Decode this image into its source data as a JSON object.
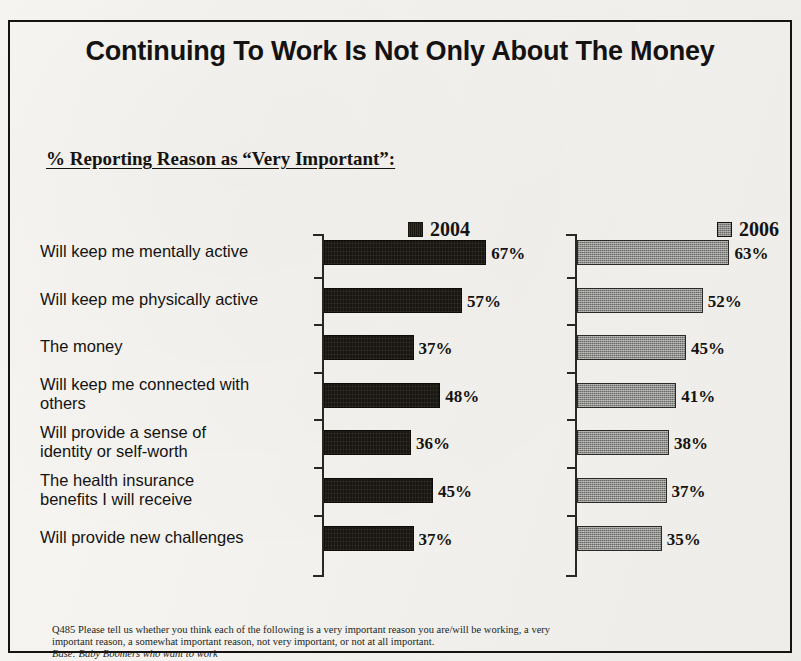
{
  "slide": {
    "title": "Continuing To Work Is Not Only About The Money",
    "subtitle": "% Reporting Reason as “Very Important”:"
  },
  "legend": [
    {
      "label": "2004",
      "swatch": "dark-square-icon",
      "color": "#181510"
    },
    {
      "label": "2006",
      "swatch": "gray-square-icon",
      "color": "#8d8d8b"
    }
  ],
  "footnote": {
    "question": "Q485  Please tell us whether you think each of the following is a very important reason you are/will be working, a very important reason, a somewhat important reason, not very important, or not at all important.",
    "base": "Base:  Baby Boomers who want to work"
  },
  "chart_data": {
    "type": "bar",
    "orientation": "horizontal",
    "title": "Continuing To Work Is Not Only About The Money",
    "subtitle": "% Reporting Reason as “Very Important”:",
    "xlabel": "",
    "ylabel": "",
    "xlim": [
      0,
      100
    ],
    "grid": false,
    "legend_position": "top",
    "panels": [
      "2004",
      "2006"
    ],
    "categories": [
      "Will keep me mentally active",
      "Will keep me physically active",
      "The money",
      "Will keep me connected with others",
      "Will provide a sense of identity or self-worth",
      "The health insurance benefits I will receive",
      "Will provide new challenges"
    ],
    "series": [
      {
        "name": "2004",
        "color": "#181510",
        "values": [
          67,
          57,
          37,
          48,
          36,
          45,
          37
        ]
      },
      {
        "name": "2006",
        "color": "#8d8d8b",
        "values": [
          63,
          52,
          45,
          41,
          38,
          37,
          35
        ]
      }
    ],
    "value_labels": {
      "2004": [
        "67%",
        "57%",
        "37%",
        "48%",
        "36%",
        "45%",
        "37%"
      ],
      "2006": [
        "63%",
        "52%",
        "45%",
        "41%",
        "38%",
        "37%",
        "35%"
      ]
    }
  },
  "category_lines": [
    [
      "Will keep me mentally active"
    ],
    [
      "Will keep me physically active"
    ],
    [
      "The money"
    ],
    [
      "Will keep me connected with",
      "others"
    ],
    [
      "Will provide a sense of",
      "identity or self-worth"
    ],
    [
      "The health insurance",
      "benefits I will receive"
    ],
    [
      "Will provide new challenges"
    ]
  ]
}
